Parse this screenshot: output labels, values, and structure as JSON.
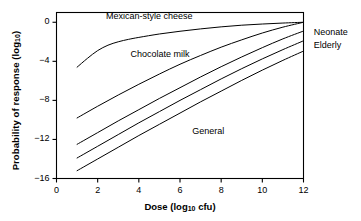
{
  "chart_data": {
    "type": "line",
    "title": "",
    "xlabel": "Dose (log10 cfu)",
    "ylabel": "Probability of response (log10)",
    "xlim": [
      0,
      12
    ],
    "ylim": [
      -16,
      1
    ],
    "xticks": [
      0,
      2,
      4,
      6,
      8,
      10,
      12
    ],
    "yticks": [
      0,
      -4,
      -8,
      -12,
      -16
    ],
    "xticklabels": [
      "0",
      "2",
      "4",
      "6",
      "8",
      "10",
      "12"
    ],
    "yticklabels": [
      "0",
      "−4",
      "−8",
      "−12",
      "−16"
    ],
    "grid": false,
    "legend_position": "inline-annotations",
    "series": [
      {
        "name": "Mexican-style cheese",
        "label_position": "inside-top-left",
        "x": [
          1,
          1.5,
          2,
          2.5,
          3,
          3.5,
          4,
          5,
          6,
          7,
          8,
          9,
          10,
          11,
          12
        ],
        "y": [
          -4.6,
          -3.7,
          -2.9,
          -2.35,
          -2.0,
          -1.75,
          -1.55,
          -1.2,
          -0.92,
          -0.68,
          -0.47,
          -0.3,
          -0.18,
          -0.08,
          0.0
        ]
      },
      {
        "name": "Chocolate milk",
        "label_position": "inside-upper-middle",
        "x": [
          1,
          2,
          3,
          4,
          5,
          6,
          7,
          8,
          9,
          10,
          11,
          12
        ],
        "y": [
          -9.8,
          -8.6,
          -7.45,
          -6.35,
          -5.3,
          -4.3,
          -3.4,
          -2.55,
          -1.8,
          -1.1,
          -0.5,
          0.0
        ]
      },
      {
        "name": "Neonate",
        "label_position": "right-edge",
        "x": [
          1,
          2,
          3,
          4,
          5,
          6,
          7,
          8,
          9,
          10,
          11,
          12
        ],
        "y": [
          -12.5,
          -11.3,
          -10.1,
          -8.95,
          -7.8,
          -6.7,
          -5.6,
          -4.55,
          -3.55,
          -2.6,
          -1.7,
          -0.9
        ]
      },
      {
        "name": "Elderly",
        "label_position": "right-edge",
        "x": [
          1,
          2,
          3,
          4,
          5,
          6,
          7,
          8,
          9,
          10,
          11,
          12
        ],
        "y": [
          -13.9,
          -12.7,
          -11.5,
          -10.3,
          -9.15,
          -8.0,
          -6.9,
          -5.8,
          -4.75,
          -3.75,
          -2.8,
          -1.9
        ]
      },
      {
        "name": "General",
        "label_position": "inside-lower-middle",
        "x": [
          1,
          2,
          3,
          4,
          5,
          6,
          7,
          8,
          9,
          10,
          11,
          12
        ],
        "y": [
          -15.2,
          -14.0,
          -12.8,
          -11.6,
          -10.45,
          -9.3,
          -8.15,
          -7.05,
          -5.95,
          -4.9,
          -3.9,
          -2.95
        ]
      }
    ],
    "annotations": [
      {
        "text": "Mexican-style cheese",
        "x": 2.4,
        "y": 0.55
      },
      {
        "text": "Chocolate milk",
        "x": 3.6,
        "y": -3.4
      },
      {
        "text": "General",
        "x": 6.6,
        "y": -11.2
      },
      {
        "text": "Neonate",
        "x": 12.5,
        "y": -1.1
      },
      {
        "text": "Elderly",
        "x": 12.5,
        "y": -2.4
      }
    ]
  },
  "axes": {
    "x_title_main": "Dose (log",
    "x_title_sub": "10",
    "x_title_tail": " cfu)",
    "y_title_main": "Probability of response (log",
    "y_title_sub": "10",
    "y_title_tail": ")"
  },
  "labels": {
    "x0": "0",
    "x2": "2",
    "x4": "4",
    "x6": "6",
    "x8": "8",
    "x10": "10",
    "x12": "12",
    "y0": "0",
    "y4": "−4",
    "y8": "−8",
    "y12": "−12",
    "y16": "−16",
    "ann_cheese": "Mexican-style cheese",
    "ann_chocolate": "Chocolate milk",
    "ann_general": "General",
    "ann_neonate": "Neonate",
    "ann_elderly": "Elderly"
  },
  "style": {
    "line_color": "#000000",
    "axis_color": "#000000",
    "background": "#ffffff"
  }
}
